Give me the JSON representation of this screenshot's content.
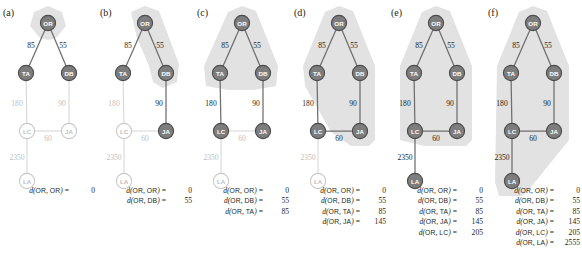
{
  "figure": {
    "type": "dijkstra-progression",
    "panel_count": 6,
    "colors": {
      "node_active_fill": "#7d7d7d",
      "node_active_stroke": "#4a4a4a",
      "node_active_text": "#ffffff",
      "node_inactive_fill": "#ffffff",
      "node_inactive_stroke": "#c9c9c9",
      "node_inactive_text": "#c0c0c0",
      "edge_active": "#6e6e6e",
      "edge_inactive": "#d4d4d4",
      "label_active": "#231f20",
      "label_inactive": "#c0c0c0",
      "highlight_fill": "#e2e2e2",
      "text": "#231f20"
    },
    "graph": {
      "nodes": [
        {
          "id": "OR",
          "label": "OR",
          "x": 48,
          "y": 23
        },
        {
          "id": "TA",
          "label": "TA",
          "x": 26,
          "y": 73
        },
        {
          "id": "DB",
          "label": "DB",
          "x": 69,
          "y": 73
        },
        {
          "id": "LC",
          "label": "LC",
          "x": 27,
          "y": 131
        },
        {
          "id": "JA",
          "label": "JA",
          "x": 69,
          "y": 131
        },
        {
          "id": "LA",
          "label": "LA",
          "x": 27,
          "y": 181
        }
      ],
      "edges": [
        {
          "from": "OR",
          "to": "TA",
          "weight": "85",
          "lx": 31,
          "ly": 45
        },
        {
          "from": "OR",
          "to": "DB",
          "weight": "55",
          "lx": 63,
          "ly": 45
        },
        {
          "from": "TA",
          "to": "LC",
          "weight": "180",
          "lx": 17,
          "ly": 103
        },
        {
          "from": "DB",
          "to": "JA",
          "weight": "90",
          "lx": 62,
          "ly": 103
        },
        {
          "from": "LC",
          "to": "JA",
          "weight": "60",
          "lx": 48,
          "ly": 138
        },
        {
          "from": "LC",
          "to": "LA",
          "weight": "2350",
          "lx": 17,
          "ly": 157
        }
      ]
    },
    "panels": [
      {
        "id": "a",
        "label": "(a)",
        "active_nodes": [
          "OR",
          "TA",
          "DB"
        ],
        "active_edges": [
          "OR-TA",
          "OR-DB"
        ],
        "highlight_points": "48,6 62,12 66,26 56,38 48,40 40,38 30,26 34,12",
        "distances": [
          {
            "source": "OR",
            "target": "OR",
            "value": "0"
          }
        ]
      },
      {
        "id": "b",
        "label": "(b)",
        "active_nodes": [
          "OR",
          "TA",
          "DB",
          "JA"
        ],
        "active_edges": [
          "OR-TA",
          "OR-DB",
          "DB-JA"
        ],
        "highlight_points": "48,6 62,11 82,64 80,82 66,88 56,82 52,66 40,38 34,12",
        "distances": [
          {
            "source": "OR",
            "target": "OR",
            "value": "0"
          },
          {
            "source": "OR",
            "target": "DB",
            "value": "55"
          }
        ]
      },
      {
        "id": "c",
        "label": "(c)",
        "active_nodes": [
          "OR",
          "TA",
          "DB",
          "JA",
          "LC"
        ],
        "active_edges": [
          "OR-TA",
          "OR-DB",
          "DB-JA",
          "TA-LC"
        ],
        "highlight_points": "48,6 62,11 84,66 82,86 60,90 34,90 12,86 10,66 34,12",
        "distances": [
          {
            "source": "OR",
            "target": "OR",
            "value": "0"
          },
          {
            "source": "OR",
            "target": "DB",
            "value": "55"
          },
          {
            "source": "OR",
            "target": "TA",
            "value": "85"
          }
        ]
      },
      {
        "id": "d",
        "label": "(d)",
        "active_nodes": [
          "OR",
          "TA",
          "DB",
          "JA",
          "LC"
        ],
        "active_edges": [
          "OR-TA",
          "OR-DB",
          "DB-JA",
          "TA-LC",
          "LC-JA"
        ],
        "highlight_points": "48,6 62,11 84,66 84,140 78,146 60,146 40,132 14,86 12,66 34,12",
        "distances": [
          {
            "source": "OR",
            "target": "OR",
            "value": "0"
          },
          {
            "source": "OR",
            "target": "DB",
            "value": "55"
          },
          {
            "source": "OR",
            "target": "TA",
            "value": "85"
          },
          {
            "source": "OR",
            "target": "JA",
            "value": "145"
          }
        ]
      },
      {
        "id": "e",
        "label": "(e)",
        "active_nodes": [
          "OR",
          "TA",
          "DB",
          "JA",
          "LC",
          "LA"
        ],
        "active_edges": [
          "OR-TA",
          "OR-DB",
          "DB-JA",
          "TA-LC",
          "LC-JA",
          "LC-LA"
        ],
        "highlight_points": "48,6 62,11 84,66 84,140 78,146 36,146 12,140 12,66 34,12",
        "distances": [
          {
            "source": "OR",
            "target": "OR",
            "value": "0"
          },
          {
            "source": "OR",
            "target": "DB",
            "value": "55"
          },
          {
            "source": "OR",
            "target": "TA",
            "value": "85"
          },
          {
            "source": "OR",
            "target": "JA",
            "value": "145"
          },
          {
            "source": "OR",
            "target": "LC",
            "value": "205"
          }
        ]
      },
      {
        "id": "f",
        "label": "(f)",
        "active_nodes": [
          "OR",
          "TA",
          "DB",
          "JA",
          "LC",
          "LA"
        ],
        "active_edges": [
          "OR-TA",
          "OR-DB",
          "DB-JA",
          "TA-LC",
          "LC-JA",
          "LC-LA"
        ],
        "highlight_points": "48,6 62,11 84,66 84,140 42,192 36,196 14,196 10,182 12,66 34,12",
        "distances": [
          {
            "source": "OR",
            "target": "OR",
            "value": "0"
          },
          {
            "source": "OR",
            "target": "DB",
            "value": "55"
          },
          {
            "source": "OR",
            "target": "TA",
            "value": "85"
          },
          {
            "source": "OR",
            "target": "JA",
            "value": "145"
          },
          {
            "source": "OR",
            "target": "LC",
            "value": "205"
          },
          {
            "source": "OR",
            "target": "LA",
            "value": "2555"
          }
        ]
      }
    ],
    "panel_x_offsets": [
      0,
      97,
      194,
      291,
      388,
      485
    ]
  }
}
